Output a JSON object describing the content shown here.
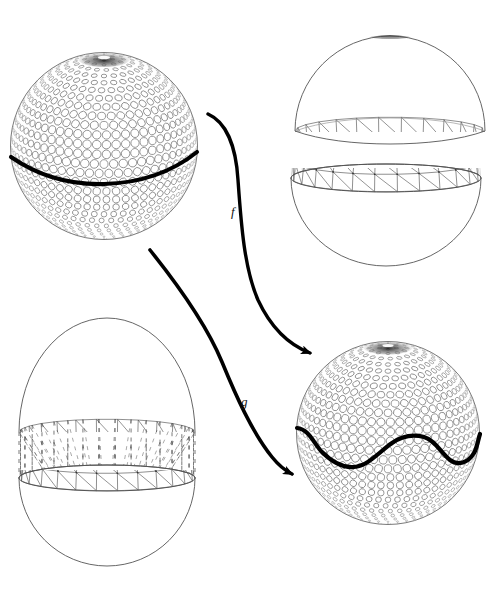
{
  "figure": {
    "background_color": "#ffffff",
    "ink_color": "#000000",
    "mesh_color": "#4a4a4a",
    "highlight_color": "#000000",
    "width": 491,
    "height": 592
  },
  "labels": {
    "map_f": "f",
    "map_g": "g"
  },
  "objects": [
    {
      "id": "source-sphere",
      "name": "packed-sphere-with-equator",
      "description": "Sphere covered by a circle packing with a thick black great-circle (equator) drawn across it",
      "center_x": 104,
      "center_y": 146,
      "radius": 94,
      "surface": "circle-packing",
      "curve": "great-circle-equator",
      "curve_style": "thick-solid"
    },
    {
      "id": "upper-dome",
      "name": "triangulated-upper-hemisphere",
      "description": "Upper hemisphere cap drawn as a triangulated geodesic mesh",
      "center_x": 390,
      "center_y": 130,
      "radius": 95,
      "surface": "triangulated-mesh",
      "part": "upper-cap"
    },
    {
      "id": "lower-bowl",
      "name": "triangulated-lower-hemisphere",
      "description": "Lower hemisphere bowl drawn as a triangulated geodesic mesh with open rim",
      "center_x": 386,
      "center_y": 168,
      "radius": 95,
      "surface": "triangulated-mesh",
      "part": "lower-bowl"
    },
    {
      "id": "capsule",
      "name": "stretched-capsule-with-dashed-band",
      "description": "Elongated capsule: triangulated dome on top, dashed cylindrical band in the middle, triangulated bowl below",
      "center_x": 107,
      "center_y": 440,
      "radius_x": 88,
      "top_y": 318,
      "bottom_y": 566,
      "surface": "triangulated-mesh",
      "band_style": "dashed"
    },
    {
      "id": "target-sphere",
      "name": "packed-sphere-with-wavy-curve",
      "description": "Sphere covered by a circle packing with a thick black wavy curve replacing the equator",
      "center_x": 388,
      "center_y": 433,
      "radius": 92,
      "surface": "circle-packing",
      "curve": "wavy-curve",
      "curve_style": "thick-solid"
    }
  ],
  "arrows": [
    {
      "id": "arrow-f",
      "name": "arrow-f",
      "label": "f",
      "from": "source-sphere",
      "to": "upper-dome-and-lower-bowl",
      "start_x": 208,
      "start_y": 114,
      "end_x": 316,
      "end_y": 356,
      "label_x": 236,
      "label_y": 212
    },
    {
      "id": "arrow-g",
      "name": "arrow-g",
      "label": "g",
      "from": "source-sphere",
      "to": "target-sphere",
      "start_x": 150,
      "start_y": 250,
      "end_x": 298,
      "end_y": 476,
      "label_x": 246,
      "label_y": 402
    }
  ]
}
